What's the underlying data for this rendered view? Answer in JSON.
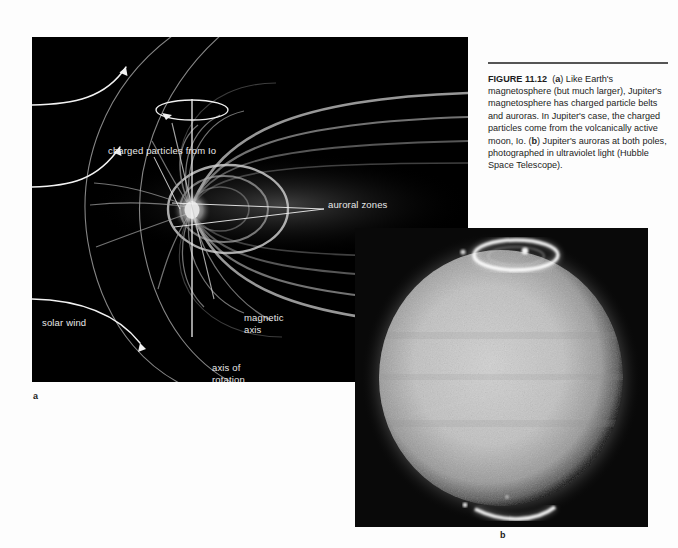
{
  "figure": {
    "number_label": "FIGURE 11.12",
    "caption_segments": {
      "part_a_tag": "a",
      "part_a_text": ") Like Earth's magnetosphere (but much larger), Jupiter's magnetosphere has charged particle belts and auroras. In Jupiter's case, the charged particles come from the volcanically active moon, Io. (",
      "part_b_tag": "b",
      "part_b_text": ") Jupiter's auroras at both poles, photographed in ultraviolet light (Hubble Space Telescope)."
    },
    "panel_letters": {
      "a": "a",
      "b": "b"
    }
  },
  "panel_a": {
    "name": "jupiter-magnetosphere-diagram",
    "background_color": "#000000",
    "labels": [
      {
        "id": "charged-particles",
        "text": "charged particles from Io"
      },
      {
        "id": "auroral-zones",
        "text": "auroral zones"
      },
      {
        "id": "solar-wind",
        "text": "solar wind"
      },
      {
        "id": "magnetic-axis-line1",
        "text": "magnetic"
      },
      {
        "id": "magnetic-axis-line2",
        "text": "axis"
      },
      {
        "id": "axis-of-rotation-line1",
        "text": "axis of"
      },
      {
        "id": "axis-of-rotation-line2",
        "text": "rotation"
      }
    ],
    "label_color": "#e8e8e8",
    "field_line_color": "#8f8f8f"
  },
  "panel_b": {
    "name": "jupiter-uv-aurora-photograph",
    "description_color": "#050505",
    "disk_color": "#b9b9b9",
    "aurora_color": "#ffffff"
  }
}
